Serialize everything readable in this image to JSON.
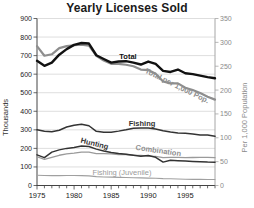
{
  "chart_data": {
    "type": "line",
    "title": "Yearly Licenses Sold",
    "x": [
      1975,
      1976,
      1977,
      1978,
      1979,
      1980,
      1981,
      1982,
      1983,
      1984,
      1985,
      1986,
      1987,
      1988,
      1989,
      1990,
      1991,
      1992,
      1993,
      1994,
      1995,
      1996,
      1997,
      1998,
      1999
    ],
    "x_major_ticks": [
      1975,
      1980,
      1985,
      1990,
      1995
    ],
    "left_axis": {
      "label": "Thousands",
      "min": 0,
      "max": 900,
      "ticks": [
        0,
        100,
        200,
        300,
        400,
        500,
        600,
        700,
        800,
        900
      ]
    },
    "right_axis": {
      "label": "Per 1,000 Population",
      "min": 0,
      "max": 350,
      "ticks": [
        0,
        50,
        100,
        150,
        200,
        250,
        300,
        350
      ]
    },
    "grid": "on",
    "colors": {
      "background": "#ffffff",
      "grid": "#dedede",
      "axis_left": "#444444",
      "axis_right": "#a6a6a6",
      "title": "#1a1a1a",
      "tick_left": "#1a1a1a",
      "tick_right": "#8a8a8a"
    },
    "series": [
      {
        "name": "Total",
        "axis": "left",
        "color": "#111111",
        "width": 2.4,
        "values": [
          672,
          645,
          662,
          705,
          735,
          758,
          768,
          765,
          702,
          682,
          662,
          668,
          670,
          662,
          652,
          668,
          655,
          618,
          612,
          625,
          605,
          600,
          592,
          584,
          578
        ],
        "label": {
          "x": 128,
          "y": 59,
          "rotate": 0,
          "color": "#111111",
          "bold": true
        }
      },
      {
        "name": "Total per 1,000 Pop.",
        "axis": "right",
        "color": "#8e8e8e",
        "width": 2.2,
        "values": [
          292,
          272,
          275,
          288,
          292,
          294,
          295,
          293,
          272,
          262,
          255,
          255,
          253,
          250,
          243,
          242,
          234,
          218,
          214,
          214,
          205,
          200,
          194,
          186,
          180
        ],
        "label": {
          "x": 176,
          "y": 88,
          "rotate": 26,
          "color": "#8e8e8e",
          "bold": true
        }
      },
      {
        "name": "Fishing",
        "axis": "left",
        "color": "#333333",
        "width": 1.5,
        "values": [
          300,
          292,
          290,
          298,
          315,
          325,
          330,
          322,
          292,
          287,
          287,
          293,
          300,
          308,
          310,
          310,
          305,
          295,
          288,
          283,
          282,
          278,
          272,
          272,
          265
        ],
        "label": {
          "x": 142,
          "y": 126,
          "rotate": 0,
          "color": "#333333",
          "bold": true
        }
      },
      {
        "name": "Hunting",
        "axis": "left",
        "color": "#333333",
        "width": 1.5,
        "values": [
          165,
          150,
          180,
          192,
          200,
          205,
          213,
          210,
          196,
          186,
          178,
          172,
          168,
          163,
          158,
          162,
          152,
          126,
          136,
          134,
          132,
          130,
          128,
          126,
          125
        ],
        "label": {
          "x": 94,
          "y": 146,
          "rotate": 14,
          "color": "#333333",
          "bold": true
        }
      },
      {
        "name": "Combination",
        "axis": "left",
        "color": "#9a9a9a",
        "width": 1.3,
        "values": [
          155,
          141,
          152,
          163,
          170,
          174,
          180,
          180,
          172,
          172,
          170,
          167,
          167,
          163,
          162,
          158,
          157,
          150,
          152,
          152,
          150,
          151,
          152,
          152,
          150
        ],
        "label": {
          "x": 158,
          "y": 153,
          "rotate": 8,
          "color": "#8e8e8e",
          "bold": true
        }
      },
      {
        "name": "Fishing (Juvenile)",
        "axis": "left",
        "color": "#a0a0a0",
        "width": 1.1,
        "values": [
          55,
          54,
          53,
          53,
          54,
          54,
          53,
          52,
          48,
          46,
          45,
          44,
          43,
          42,
          41,
          40,
          39,
          37,
          36,
          35,
          34,
          33,
          33,
          32,
          32
        ],
        "label": {
          "x": 122,
          "y": 175,
          "rotate": 0,
          "color": "#9a9a9a",
          "bold": false
        }
      }
    ]
  }
}
